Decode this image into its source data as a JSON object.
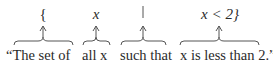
{
  "diagram": {
    "columns": [
      {
        "symbol": "{",
        "phrase": "“The set of"
      },
      {
        "symbol": "x",
        "phrase": "all x"
      },
      {
        "symbol": "|",
        "phrase": "such that"
      },
      {
        "symbol": "x < 2}",
        "phrase": "x is less than 2.”"
      }
    ],
    "colors": {
      "ink": "#2a2a2a",
      "lines": "#555555",
      "background": "#ffffff"
    }
  }
}
